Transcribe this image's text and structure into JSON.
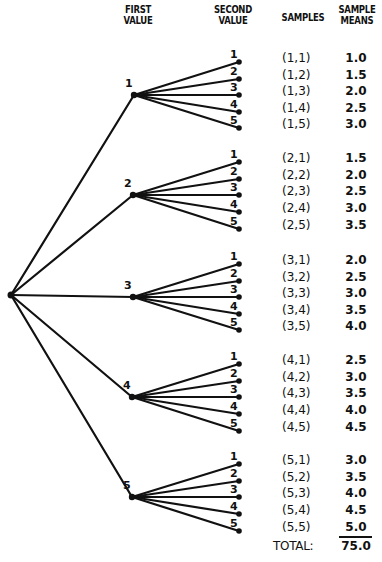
{
  "headers": {
    "first_value": "FIRST\nVALUE",
    "second_value": "SECOND\nVALUE",
    "samples": "SAMPLES",
    "sample_means": "SAMPLE\nMEANS"
  },
  "tree": {
    "root": {
      "x": 11,
      "y": 295
    },
    "leaf_x": 239,
    "branches": [
      {
        "label": "1",
        "x": 134,
        "y": 95,
        "leaves": [
          62,
          79,
          95,
          112,
          128
        ]
      },
      {
        "label": "2",
        "x": 133,
        "y": 195,
        "leaves": [
          162,
          179,
          195,
          212,
          229
        ]
      },
      {
        "label": "3",
        "x": 133,
        "y": 297,
        "leaves": [
          264,
          281,
          297,
          314,
          330
        ]
      },
      {
        "label": "4",
        "x": 132,
        "y": 397,
        "leaves": [
          364,
          381,
          397,
          414,
          431
        ]
      },
      {
        "label": "5",
        "x": 132,
        "y": 497,
        "leaves": [
          464,
          481,
          497,
          514,
          531
        ]
      }
    ],
    "leaf_labels": [
      "1",
      "2",
      "3",
      "4",
      "5"
    ]
  },
  "rows": [
    {
      "sample": "(1,1)",
      "mean": "1.0"
    },
    {
      "sample": "(1,2)",
      "mean": "1.5"
    },
    {
      "sample": "(1,3)",
      "mean": "2.0"
    },
    {
      "sample": "(1,4)",
      "mean": "2.5"
    },
    {
      "sample": "(1,5)",
      "mean": "3.0"
    },
    {
      "sample": "(2,1)",
      "mean": "1.5"
    },
    {
      "sample": "(2,2)",
      "mean": "2.0"
    },
    {
      "sample": "(2,3)",
      "mean": "2.5"
    },
    {
      "sample": "(2,4)",
      "mean": "3.0"
    },
    {
      "sample": "(2,5)",
      "mean": "3.5"
    },
    {
      "sample": "(3,1)",
      "mean": "2.0"
    },
    {
      "sample": "(3,2)",
      "mean": "2.5"
    },
    {
      "sample": "(3,3)",
      "mean": "3.0"
    },
    {
      "sample": "(3,4)",
      "mean": "3.5"
    },
    {
      "sample": "(3,5)",
      "mean": "4.0"
    },
    {
      "sample": "(4,1)",
      "mean": "2.5"
    },
    {
      "sample": "(4,2)",
      "mean": "3.0"
    },
    {
      "sample": "(4,3)",
      "mean": "3.5"
    },
    {
      "sample": "(4,4)",
      "mean": "4.0"
    },
    {
      "sample": "(4,5)",
      "mean": "4.5"
    },
    {
      "sample": "(5,1)",
      "mean": "3.0"
    },
    {
      "sample": "(5,2)",
      "mean": "3.5"
    },
    {
      "sample": "(5,3)",
      "mean": "4.0"
    },
    {
      "sample": "(5,4)",
      "mean": "4.5"
    },
    {
      "sample": "(5,5)",
      "mean": "5.0"
    }
  ],
  "total": {
    "label": "TOTAL:",
    "value": "75.0"
  },
  "colors": {
    "ink": "#111111",
    "background": "#ffffff"
  }
}
